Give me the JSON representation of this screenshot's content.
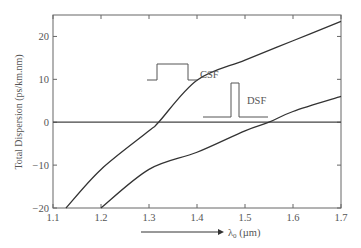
{
  "chart_data": {
    "type": "line",
    "title": "",
    "xlabel": "λ0 (µm)",
    "xlabel_main": "λ",
    "xlabel_sub": "0",
    "xlabel_unit": " (µm)",
    "ylabel": "Total Dispersion (ps/km.nm)",
    "xlim": [
      1.1,
      1.7
    ],
    "ylim": [
      -20,
      25
    ],
    "x_ticks": [
      1.1,
      1.2,
      1.3,
      1.4,
      1.5,
      1.6,
      1.7
    ],
    "x_tick_labels": [
      "1.1",
      "1.2",
      "1.3",
      "1.4",
      "1.5",
      "1.6",
      "1.7"
    ],
    "y_ticks": [
      -20,
      -10,
      0,
      10,
      20
    ],
    "y_tick_labels": [
      "−20",
      "−10",
      "0",
      "10",
      "20"
    ],
    "grid": false,
    "legend": "inline annotations",
    "series": [
      {
        "name": "CSF",
        "x": [
          1.127,
          1.2,
          1.3,
          1.32,
          1.4,
          1.5,
          1.6,
          1.7
        ],
        "values": [
          -20,
          -11,
          -2,
          0,
          9.8,
          14.5,
          19,
          23.5
        ]
      },
      {
        "name": "DSF",
        "x": [
          1.2,
          1.3,
          1.4,
          1.5,
          1.55,
          1.6,
          1.7
        ],
        "values": [
          -20,
          -11,
          -7,
          -2,
          0,
          2.5,
          6
        ]
      }
    ],
    "annotations": [
      {
        "text": "CSF",
        "description": "broad rectangular pulse inset",
        "x_px": 200,
        "y_px": 78
      },
      {
        "text": "DSF",
        "description": "narrow rectangular pulse inset",
        "x_px": 247,
        "y_px": 104
      }
    ],
    "zero_line": 0
  },
  "labels": {
    "ylabel": "Total Dispersion (ps/km.nm)",
    "csf": "CSF",
    "dsf": "DSF"
  }
}
